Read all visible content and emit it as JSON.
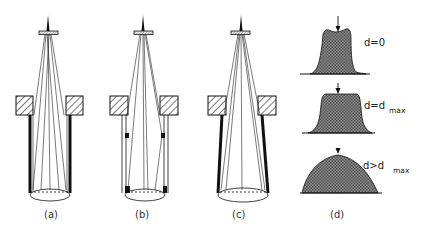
{
  "figure": {
    "panels": [
      {
        "id": "a",
        "label": "(a)",
        "description": "Source cone with thick straight tube walls"
      },
      {
        "id": "b",
        "label": "(b)",
        "description": "Source cone with thin double walls and small black apertures"
      },
      {
        "id": "c",
        "label": "(c)",
        "description": "Source cone with tapered thick walls"
      },
      {
        "id": "d",
        "label": "(d)",
        "description": "Intensity profiles for different distances d"
      }
    ],
    "profiles": [
      {
        "id": "profile-1",
        "label_main": "d=0",
        "label_sub": ""
      },
      {
        "id": "profile-2",
        "label_main": "d=d",
        "label_sub": "max"
      },
      {
        "id": "profile-3",
        "label_main": "d>d",
        "label_sub": "max"
      }
    ],
    "colors": {
      "ink": "#111111",
      "hatch": "#222222",
      "fill_profile": "#6a6a6a",
      "background": "#ffffff"
    }
  }
}
